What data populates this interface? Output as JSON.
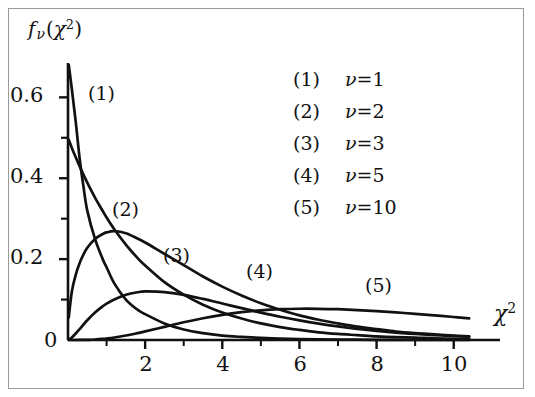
{
  "figure": {
    "background": "#ffffff",
    "border_color": "#9a9a9a",
    "ink_color": "#111111"
  },
  "labels": {
    "ylabel_f": "f",
    "ylabel_nu": "ν",
    "ylabel_open": "(",
    "ylabel_chi": "χ",
    "ylabel_exp": "2",
    "ylabel_close": ")",
    "xlabel_chi": "χ",
    "xlabel_exp": "2"
  },
  "legend": {
    "entries": [
      {
        "tag": "(1)",
        "nu_symbol": "ν",
        "equals": "=",
        "value": "1"
      },
      {
        "tag": "(2)",
        "nu_symbol": "ν",
        "equals": "=",
        "value": "2"
      },
      {
        "tag": "(3)",
        "nu_symbol": "ν",
        "equals": "=",
        "value": "3"
      },
      {
        "tag": "(4)",
        "nu_symbol": "ν",
        "equals": "=",
        "value": "5"
      },
      {
        "tag": "(5)",
        "nu_symbol": "ν",
        "equals": "=",
        "value": "10"
      }
    ]
  },
  "curve_tags": [
    {
      "text": "(1)",
      "x": 88,
      "y": 82
    },
    {
      "text": "(2)",
      "x": 112,
      "y": 198
    },
    {
      "text": "(3)",
      "x": 163,
      "y": 244
    },
    {
      "text": "(4)",
      "x": 246,
      "y": 260
    },
    {
      "text": "(5)",
      "x": 365,
      "y": 274
    }
  ],
  "axis_ticks": {
    "y_major": [
      {
        "label": "0.6",
        "value": 0.6
      },
      {
        "label": "0.4",
        "value": 0.4
      },
      {
        "label": "0.2",
        "value": 0.2
      },
      {
        "label": "0",
        "value": 0.0
      }
    ],
    "y_minor": [
      0.5,
      0.3,
      0.1
    ],
    "x_major": [
      {
        "label": "2",
        "value": 2
      },
      {
        "label": "4",
        "value": 4
      },
      {
        "label": "6",
        "value": 6
      },
      {
        "label": "8",
        "value": 8
      },
      {
        "label": "10",
        "value": 10
      }
    ],
    "x_minor": [
      1,
      3,
      5,
      7,
      9
    ]
  },
  "chart_data": {
    "type": "line",
    "title": "",
    "xlabel": "χ²",
    "ylabel": "fν(χ²)",
    "xlim": [
      0,
      11.2
    ],
    "ylim": [
      0,
      0.68
    ],
    "grid": false,
    "legend_position": "upper-right",
    "x": [
      0.02,
      0.1,
      0.2,
      0.3,
      0.4,
      0.5,
      0.7,
      0.9,
      1.0,
      1.2,
      1.5,
      1.8,
      2.0,
      2.5,
      3.0,
      3.5,
      4.0,
      4.5,
      5.0,
      5.5,
      6.0,
      6.5,
      7.0,
      7.5,
      8.0,
      8.5,
      9.0,
      9.5,
      10.0,
      10.4
    ],
    "series": [
      {
        "name": "ν=1",
        "tag": "(1)",
        "df": 1,
        "values": [
          0.68,
          0.62,
          0.54,
          0.45,
          0.38,
          0.32,
          0.25,
          0.2,
          0.18,
          0.14,
          0.1,
          0.075,
          0.064,
          0.041,
          0.026,
          0.017,
          0.011,
          0.0076,
          0.0051,
          0.0035,
          0.0024,
          0.0016,
          0.0011,
          0.0008,
          0.0005,
          0.0004,
          0.0003,
          0.0002,
          0.0001,
          0.0001
        ]
      },
      {
        "name": "ν=2",
        "tag": "(2)",
        "df": 2,
        "values": [
          0.495,
          0.475,
          0.452,
          0.43,
          0.409,
          0.389,
          0.352,
          0.319,
          0.303,
          0.274,
          0.236,
          0.203,
          0.184,
          0.143,
          0.112,
          0.087,
          0.068,
          0.053,
          0.041,
          0.032,
          0.025,
          0.019,
          0.015,
          0.012,
          0.009,
          0.007,
          0.006,
          0.004,
          0.003,
          0.003
        ]
      },
      {
        "name": "ν=3",
        "tag": "(3)",
        "df": 3,
        "values": [
          0.056,
          0.12,
          0.161,
          0.19,
          0.211,
          0.228,
          0.25,
          0.262,
          0.266,
          0.269,
          0.264,
          0.251,
          0.241,
          0.213,
          0.185,
          0.157,
          0.132,
          0.11,
          0.091,
          0.075,
          0.061,
          0.05,
          0.041,
          0.033,
          0.027,
          0.021,
          0.017,
          0.014,
          0.011,
          0.009
        ]
      },
      {
        "name": "ν=5",
        "tag": "(4)",
        "df": 5,
        "values": [
          0.0006,
          0.0062,
          0.016,
          0.0269,
          0.038,
          0.0487,
          0.0677,
          0.0833,
          0.0898,
          0.1004,
          0.1118,
          0.1181,
          0.12,
          0.1186,
          0.1117,
          0.1016,
          0.0902,
          0.0787,
          0.0677,
          0.0575,
          0.0484,
          0.0404,
          0.0335,
          0.0276,
          0.0226,
          0.0184,
          0.0149,
          0.0121,
          0.0097,
          0.0082
        ]
      },
      {
        "name": "ν=10",
        "tag": "(5)",
        "df": 10,
        "values": [
          0.0,
          0.0,
          0.0,
          0.0001,
          0.0002,
          0.0004,
          0.0012,
          0.0027,
          0.0037,
          0.0062,
          0.0111,
          0.017,
          0.0213,
          0.0325,
          0.0438,
          0.0538,
          0.0623,
          0.0688,
          0.0733,
          0.0761,
          0.0773,
          0.0772,
          0.0761,
          0.0741,
          0.0714,
          0.0682,
          0.0647,
          0.0609,
          0.0569,
          0.0536
        ]
      }
    ]
  }
}
